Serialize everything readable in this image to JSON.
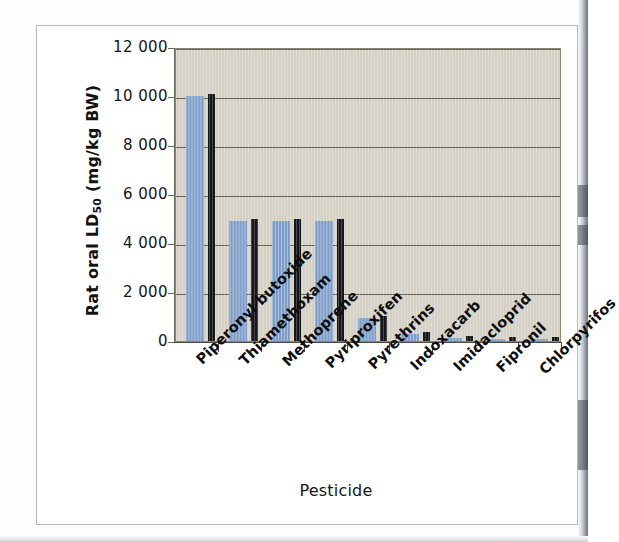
{
  "figure": {
    "background": "#ffffff",
    "plot_background": "#d5d1c7",
    "bar_color": "#7e9ec9",
    "bar_shadow_color": "#14161c",
    "gridline_color": "#5d5a4c",
    "axis_color": "#4e4c42"
  },
  "chart_data": {
    "type": "bar",
    "title": "",
    "xlabel": "Pesticide",
    "ylabel": "Rat oral LD50 (mg/kg BW)",
    "ylabel_parts": {
      "prefix": "Rat oral LD",
      "subscript": "50",
      "suffix": " (mg/kg BW)"
    },
    "categories": [
      "Piperonyl butoxide",
      "Thiamethoxam",
      "Methoprene",
      "Pyriproxifen",
      "Pyrethrins",
      "Indoxacarb",
      "Imidacloprid",
      "Fipronil",
      "Chlorpyrifos"
    ],
    "values": [
      10000,
      4900,
      4900,
      4900,
      940,
      268,
      131,
      97,
      64
    ],
    "ylim": [
      0,
      12000
    ],
    "ytick_values": [
      0,
      2000,
      4000,
      6000,
      8000,
      10000,
      12000
    ],
    "ytick_labels": [
      "0",
      "2 000",
      "4 000",
      "6 000",
      "8 000",
      "10 000",
      "12 000"
    ],
    "grid": true,
    "grid_axis": "y",
    "legend": false,
    "legend_position": "none",
    "series": [
      {
        "name": "Rat oral LD50",
        "values": [
          10000,
          4900,
          4900,
          4900,
          940,
          268,
          131,
          97,
          64
        ]
      }
    ]
  }
}
